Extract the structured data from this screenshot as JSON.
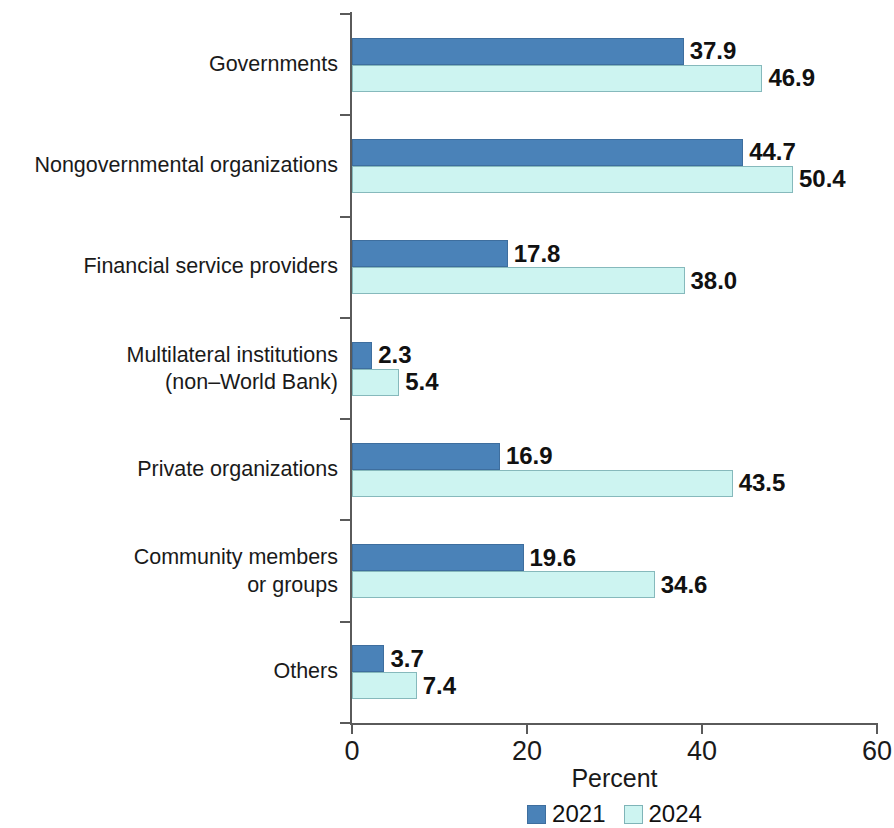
{
  "chart_data": {
    "type": "bar",
    "orientation": "horizontal",
    "title": "",
    "xlabel": "Percent",
    "ylabel": "",
    "xlim": [
      0,
      60
    ],
    "xticks": [
      0,
      20,
      40,
      60
    ],
    "xtick_labels": [
      "0",
      "20",
      "40",
      "60"
    ],
    "grid": false,
    "legend_position": "bottom-center",
    "categories": [
      "Governments",
      "Nongovernmental organizations",
      "Financial service providers",
      "Multilateral institutions\n(non–World Bank)",
      "Private organizations",
      "Community members\nor groups",
      "Others"
    ],
    "series": [
      {
        "name": "2021",
        "color": "#4a82b8",
        "values": [
          37.9,
          44.7,
          17.8,
          2.3,
          16.9,
          19.6,
          3.7
        ],
        "value_labels": [
          "37.9",
          "44.7",
          "17.8",
          "2.3",
          "16.9",
          "19.6",
          "3.7"
        ]
      },
      {
        "name": "2024",
        "color": "#cdf4f1",
        "values": [
          46.9,
          50.4,
          38.0,
          5.4,
          43.5,
          34.6,
          7.4
        ],
        "value_labels": [
          "46.9",
          "50.4",
          "38.0",
          "5.4",
          "43.5",
          "34.6",
          "7.4"
        ]
      }
    ]
  },
  "axis": {
    "x_title": "Percent"
  },
  "legend": {
    "items": [
      {
        "label": "2021",
        "color": "#4a82b8"
      },
      {
        "label": "2024",
        "color": "#cdf4f1"
      }
    ]
  },
  "colors": {
    "series_2021": "#4a82b8",
    "series_2024": "#cdf4f1",
    "axis": "#5a5a5a",
    "text": "#1a1a1a",
    "background": "#ffffff"
  }
}
